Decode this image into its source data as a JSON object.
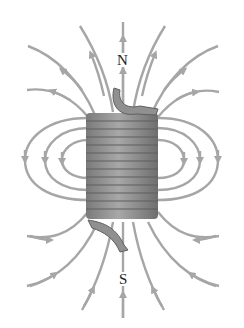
{
  "diagram": {
    "labels": {
      "north": "N",
      "south": "S"
    },
    "colors": {
      "field_line": "#a6a6a6",
      "coil": "#8c8c8c",
      "coil_dark": "#5e5e5e",
      "label": "#222222",
      "background": "#ffffff"
    },
    "coil_turns": 13
  }
}
